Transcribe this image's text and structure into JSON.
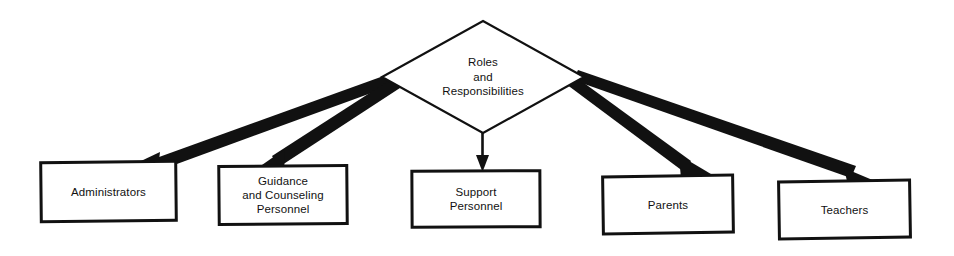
{
  "diagram": {
    "type": "hierarchy-tree",
    "orientation": "top-down",
    "background_color": "#ffffff",
    "line_color": "#111111",
    "text_color": "#111111",
    "root": {
      "shape": "diamond",
      "name": "roles-and-responsibilities",
      "lines": [
        "Roles",
        "and",
        "Responsibilities"
      ],
      "text": "Roles and Responsibilities",
      "cx": 483,
      "cy": 77,
      "rx": 101,
      "ry": 56
    },
    "children": [
      {
        "shape": "rectangle",
        "name": "administrators",
        "lines": [
          "Administrators"
        ],
        "text": "Administrators",
        "x": 41,
        "y": 162,
        "width": 135,
        "height": 59,
        "rotate": -0.6
      },
      {
        "shape": "rectangle",
        "name": "guidance-and-counseling-personnel",
        "lines": [
          "Guidance",
          "and Counseling",
          "Personnel"
        ],
        "text": "Guidance and Counseling Personnel",
        "x": 219,
        "y": 166,
        "width": 128,
        "height": 58,
        "rotate": -0.5
      },
      {
        "shape": "rectangle",
        "name": "support-personnel",
        "lines": [
          "Support",
          "Personnel"
        ],
        "text": "Support Personnel",
        "x": 412,
        "y": 171,
        "width": 128,
        "height": 56,
        "rotate": -0.3
      },
      {
        "shape": "rectangle",
        "name": "parents",
        "lines": [
          "Parents"
        ],
        "text": "Parents",
        "x": 603,
        "y": 176,
        "width": 130,
        "height": 57,
        "rotate": -0.8
      },
      {
        "shape": "rectangle",
        "name": "teachers",
        "lines": [
          "Teachers"
        ],
        "text": "Teachers",
        "x": 779,
        "y": 181,
        "width": 131,
        "height": 57,
        "rotate": -0.9
      }
    ],
    "connectors": [
      {
        "name": "connector-to-administrators",
        "from": "roles-and-responsibilities",
        "to": "administrators",
        "style": "tapered-arrow",
        "head": "filled-triangle"
      },
      {
        "name": "connector-to-guidance-and-counseling-personnel",
        "from": "roles-and-responsibilities",
        "to": "guidance-and-counseling-personnel",
        "style": "tapered-arrow",
        "head": "filled-triangle"
      },
      {
        "name": "connector-to-support-personnel",
        "from": "roles-and-responsibilities",
        "to": "support-personnel",
        "style": "thin-arrow",
        "head": "filled-triangle"
      },
      {
        "name": "connector-to-parents",
        "from": "roles-and-responsibilities",
        "to": "parents",
        "style": "tapered-arrow",
        "head": "filled-triangle"
      },
      {
        "name": "connector-to-teachers",
        "from": "roles-and-responsibilities",
        "to": "teachers",
        "style": "tapered-arrow",
        "head": "filled-triangle"
      }
    ]
  }
}
